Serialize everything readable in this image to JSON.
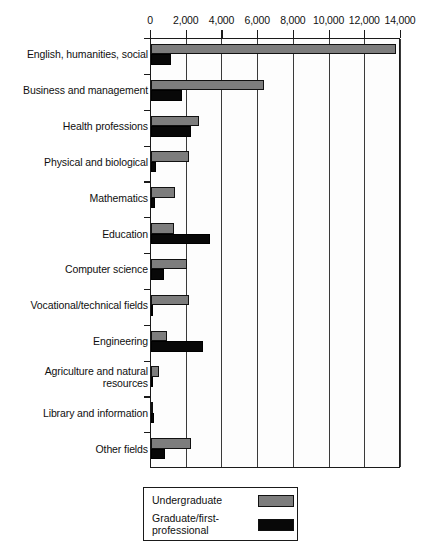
{
  "chart_data": {
    "type": "bar",
    "orientation": "horizontal",
    "title": "",
    "subtitle": "",
    "xlabel": "",
    "ylabel": "",
    "xlim": [
      0,
      14000
    ],
    "xticks": [
      0,
      2000,
      4000,
      6000,
      8000,
      10000,
      12000,
      14000
    ],
    "xticklabels": [
      "0",
      "2,000",
      "4,000",
      "6,000",
      "8,000",
      "10,000",
      "12,000",
      "14,000"
    ],
    "grid": true,
    "legend_position": "bottom-center",
    "categories": [
      "English, humanities, social",
      "Business and management",
      "Health professions",
      "Physical and biological",
      "Mathematics",
      "Education",
      "Computer science",
      "Vocational/technical fields",
      "Engineering",
      "Agriculture and natural\nresources",
      "Library and information",
      "Other fields"
    ],
    "series": [
      {
        "name": "Undergraduate",
        "color": "#7d7d7d",
        "values": [
          13700,
          6300,
          2700,
          2100,
          1350,
          1300,
          2000,
          2150,
          900,
          450,
          80,
          2250
        ]
      },
      {
        "name": "Graduate/first-professional",
        "color": "#080808",
        "values": [
          1100,
          1750,
          2250,
          300,
          200,
          3300,
          700,
          30,
          2900,
          40,
          150,
          800
        ]
      }
    ]
  },
  "legend": {
    "entries": [
      {
        "label": "Undergraduate",
        "swatch": "undergraduate-swatch"
      },
      {
        "label": "Graduate/first-professional",
        "swatch": "graduate-swatch"
      }
    ]
  }
}
